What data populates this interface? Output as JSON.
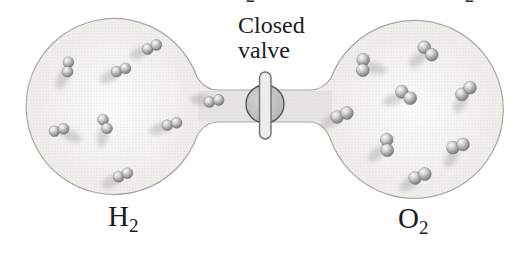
{
  "figure": {
    "valve_label_line1": "Closed",
    "valve_label_line2": "valve",
    "left_gas_symbol": "H",
    "left_gas_subscript": "2",
    "right_gas_symbol": "O",
    "right_gas_subscript": "2",
    "clipped_top_text": {
      "left_fragment": "2",
      "right_fragment": "2"
    }
  },
  "colors": {
    "background": "#ffffff",
    "apparatus_fill": "#f0efec",
    "apparatus_stipple": "#cfcecb",
    "apparatus_outline": "#9a9a98",
    "tube_shade": "#dddcd9",
    "valve_fill": "#c4c4c2",
    "valve_outline": "#4f4f4d",
    "handle_fill": "#ececea",
    "handle_outline": "#6f6f6d",
    "molecule_sphere": "#8a8a8a",
    "label_text": "#1c1c1c"
  },
  "diagram": {
    "left_bulb": {
      "cx": 115,
      "cy": 106,
      "r": 88,
      "gas": "H2"
    },
    "right_bulb": {
      "cx": 414,
      "cy": 111,
      "r": 89,
      "gas": "O2"
    },
    "tube": {
      "x1": 197,
      "x2": 333,
      "y_top": 90,
      "y_bottom": 122
    },
    "valve": {
      "cx": 265,
      "cy": 104,
      "r": 19,
      "handle_x": 259.5,
      "handle_y": 72,
      "handle_w": 11.5,
      "handle_h": 67
    },
    "h2_molecules": [
      {
        "x": 68,
        "y": 67,
        "angle": 95,
        "shadow": 115
      },
      {
        "x": 121,
        "y": 70,
        "angle": -20,
        "shadow": 150
      },
      {
        "x": 152,
        "y": 47,
        "angle": -25,
        "shadow": 155
      },
      {
        "x": 214,
        "y": 101,
        "angle": -12,
        "shadow": 185
      },
      {
        "x": 105,
        "y": 124,
        "angle": 65,
        "shadow": 100
      },
      {
        "x": 172,
        "y": 124,
        "angle": -15,
        "shadow": 160
      },
      {
        "x": 59,
        "y": 130,
        "angle": -15,
        "shadow": 25
      },
      {
        "x": 123,
        "y": 175,
        "angle": -22,
        "shadow": 150
      }
    ],
    "o2_molecules": [
      {
        "x": 363,
        "y": 65,
        "angle": 92,
        "shadow": 15
      },
      {
        "x": 428,
        "y": 51,
        "angle": 45,
        "shadow": 140
      },
      {
        "x": 466,
        "y": 91,
        "angle": -40,
        "shadow": 115
      },
      {
        "x": 406,
        "y": 95,
        "angle": 37,
        "shadow": 160
      },
      {
        "x": 342,
        "y": 115,
        "angle": -22,
        "shadow": 150
      },
      {
        "x": 387,
        "y": 145,
        "angle": 87,
        "shadow": 140
      },
      {
        "x": 458,
        "y": 146,
        "angle": -17,
        "shadow": 120
      },
      {
        "x": 420,
        "y": 176,
        "angle": -22,
        "shadow": 145
      }
    ]
  }
}
